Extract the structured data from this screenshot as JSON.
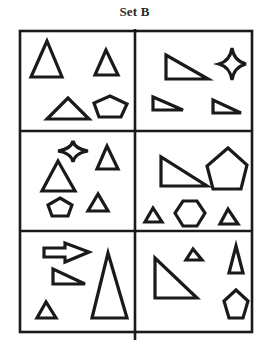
{
  "title": "Set B",
  "colors": {
    "stroke": "#1a1a1a",
    "background": "#ffffff",
    "title": "#2b2b2b"
  },
  "grid": {
    "rows": 3,
    "cols": 2,
    "frame": {
      "x1": 20,
      "y1": 31,
      "x2": 252,
      "y2": 332
    },
    "vertical_divider_x": 135,
    "horizontal_dividers_y": [
      131,
      231
    ]
  },
  "panels": [
    {
      "id": 1,
      "position": "row1-left",
      "shapes": [
        {
          "type": "triangle",
          "label": "large isosceles triangle"
        },
        {
          "type": "triangle",
          "label": "small isosceles triangle"
        },
        {
          "type": "triangle",
          "label": "wide flat triangle"
        },
        {
          "type": "pentagon",
          "label": "small pentagon"
        }
      ]
    },
    {
      "id": 2,
      "position": "row1-right",
      "shapes": [
        {
          "type": "right-triangle",
          "label": "right triangle"
        },
        {
          "type": "star",
          "label": "four-point star"
        },
        {
          "type": "right-triangle",
          "label": "small right triangle left"
        },
        {
          "type": "right-triangle",
          "label": "small right triangle right"
        }
      ]
    },
    {
      "id": 3,
      "position": "row2-left",
      "shapes": [
        {
          "type": "star",
          "label": "four-point star"
        },
        {
          "type": "triangle",
          "label": "upper right triangle"
        },
        {
          "type": "triangle",
          "label": "medium triangle"
        },
        {
          "type": "pentagon",
          "label": "small pentagon"
        },
        {
          "type": "triangle",
          "label": "small triangle"
        }
      ]
    },
    {
      "id": 4,
      "position": "row2-right",
      "shapes": [
        {
          "type": "right-triangle",
          "label": "right triangle"
        },
        {
          "type": "pentagon",
          "label": "large pentagon"
        },
        {
          "type": "triangle",
          "label": "small triangle left"
        },
        {
          "type": "hexagon",
          "label": "hexagon"
        },
        {
          "type": "triangle",
          "label": "small triangle right"
        }
      ]
    },
    {
      "id": 5,
      "position": "row3-left",
      "shapes": [
        {
          "type": "arrow",
          "label": "right arrow"
        },
        {
          "type": "right-triangle",
          "label": "right triangle"
        },
        {
          "type": "triangle",
          "label": "tall triangle"
        },
        {
          "type": "triangle",
          "label": "small triangle"
        }
      ]
    },
    {
      "id": 6,
      "position": "row3-right",
      "shapes": [
        {
          "type": "triangle",
          "label": "small triangle"
        },
        {
          "type": "triangle",
          "label": "narrow tall triangle"
        },
        {
          "type": "right-triangle",
          "label": "right triangle"
        },
        {
          "type": "pentagon",
          "label": "pentagon"
        }
      ]
    }
  ]
}
